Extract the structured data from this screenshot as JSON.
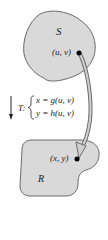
{
  "diagram": {
    "type": "transformation-mapping",
    "regions": {
      "source": {
        "label": "S",
        "point": "(u, v)"
      },
      "target": {
        "label": "R",
        "point": "(x, y)"
      }
    },
    "transformation": {
      "name": "T:",
      "equations": [
        "x = g(u, v)",
        "y = h(u, v)"
      ]
    },
    "colors": {
      "region_fill": "#d9d9d9",
      "region_stroke": "#6b6b6b",
      "arrow_fill": "#cfcfcf",
      "arrow_stroke": "#6b6b6b",
      "text": "#222222"
    }
  }
}
